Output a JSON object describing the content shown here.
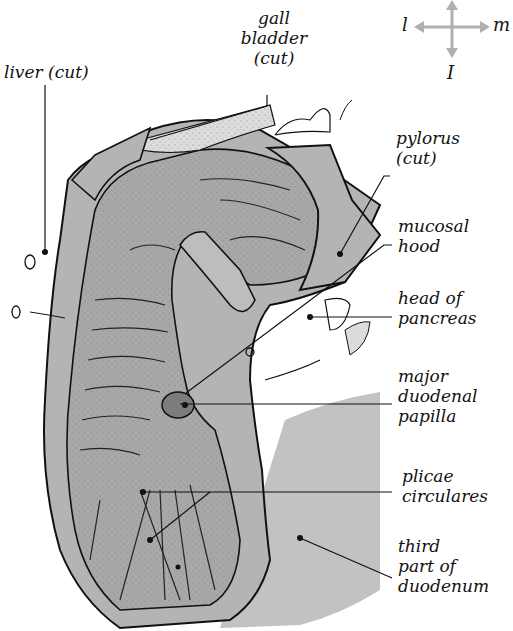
{
  "figure": {
    "colors": {
      "tissue_gray": "#b4b4b4",
      "light_gray": "#c8c8c8",
      "papilla_gray": "#7c7c7c",
      "outline": "#111111",
      "compass_gray": "#b0b0b0"
    }
  },
  "compass": {
    "left": "l",
    "right": "m",
    "bottom": "I"
  },
  "labels": {
    "liver": "liver (cut)",
    "gall_bladder": "gall\nbladder\n(cut)",
    "pylorus": "pylorus\n(cut)",
    "mucosal_hood": "mucosal\nhood",
    "head_of_pancreas": "head of\npancreas",
    "major_duodenal_papilla": "major\nduodenal\npapilla",
    "plicae_circulares": "plicae\ncirculares",
    "third_part_of_duodenum": "third\npart of\nduodenum"
  }
}
